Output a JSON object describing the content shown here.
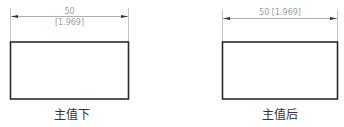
{
  "figures": [
    {
      "id": "below",
      "caption": "主值下",
      "dimension": {
        "primary": "50",
        "alternate": "[1.969]",
        "layout": "stacked"
      }
    },
    {
      "id": "after",
      "caption": "主值后",
      "dimension": {
        "primary": "50 [1.969]",
        "layout": "inline"
      }
    }
  ],
  "colors": {
    "outline": "#2b2b2b",
    "dimension": "#9a9a9a",
    "caption": "#333333"
  }
}
